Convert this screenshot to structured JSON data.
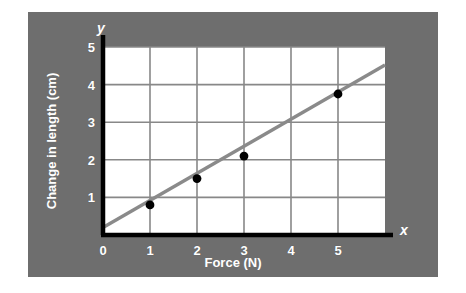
{
  "figure": {
    "panel_color": "#6e6e6e",
    "plot_background": "#ffffff",
    "axis_color": "#000000",
    "grid_color": "#888888",
    "line_color": "#8a8a8a",
    "point_color": "#000000",
    "label_color": "#ffffff",
    "axis_name_x": "x",
    "axis_name_y": "y"
  },
  "chart_data": {
    "type": "scatter",
    "title": "",
    "xlabel": "Force (N)",
    "ylabel": "Change in length (cm)",
    "xlim": [
      0,
      6
    ],
    "ylim": [
      0,
      5
    ],
    "xticks": [
      "0",
      "1",
      "2",
      "3",
      "4",
      "5"
    ],
    "yticks": [
      "1",
      "2",
      "3",
      "4",
      "5"
    ],
    "xtick_values": [
      0,
      1,
      2,
      3,
      4,
      5
    ],
    "ytick_values": [
      1,
      2,
      3,
      4,
      5
    ],
    "grid": true,
    "legend": "none",
    "x": [
      1,
      2,
      3,
      5
    ],
    "values": [
      0.8,
      1.5,
      2.1,
      3.75
    ],
    "points": [
      {
        "x": 1,
        "y": 0.8
      },
      {
        "x": 2,
        "y": 1.5
      },
      {
        "x": 3,
        "y": 2.1
      },
      {
        "x": 5,
        "y": 3.75
      }
    ],
    "series": [
      {
        "name": "Measured extension",
        "type": "scatter",
        "x": [
          1,
          2,
          3,
          5
        ],
        "values": [
          0.8,
          1.5,
          2.1,
          3.75
        ]
      },
      {
        "name": "Line of best fit",
        "type": "line",
        "x": [
          0,
          6
        ],
        "values": [
          0.2,
          4.52
        ]
      }
    ],
    "best_fit": {
      "x_start": 0,
      "y_start": 0.2,
      "x_end": 6,
      "y_end": 4.52,
      "slope": 0.72,
      "intercept": 0.2
    }
  }
}
